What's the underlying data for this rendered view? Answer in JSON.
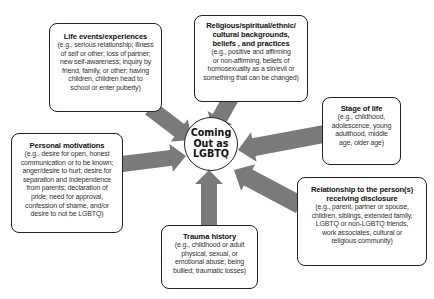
{
  "center": {
    "label_lines": [
      "Coming",
      "Out as",
      "LGBTQ"
    ]
  },
  "arrow_color": "#7a7a7a",
  "factors": [
    {
      "id": "life-events",
      "title": "Life events/experiences",
      "description_lines": [
        "(e.g., serious relationship; illness",
        "of self or other; loss of partner;",
        "new self-awareness; inquiry by",
        "friend, family, or other; having",
        "children, children head to",
        "school or enter puberty)"
      ]
    },
    {
      "id": "religious",
      "title_lines": [
        "Religious/spiritual/ethnic/",
        "cultural backgrounds,",
        "beliefs , and practices"
      ],
      "description_lines": [
        "(e.g., positive and affirming",
        "or non-affirming, beliefs of",
        "homosexuality as a sin/evil or",
        "something that can be changed)"
      ]
    },
    {
      "id": "stage-of-life",
      "title": "Stage of life",
      "description_lines": [
        "(e.g., childhood,",
        "adolescence, young",
        "adulthood, middle",
        "age, older age)"
      ]
    },
    {
      "id": "personal-motivations",
      "title": "Personal motivations",
      "description_lines": [
        "(e.g., desire for open, honest",
        "communication or to be known;",
        "anger/desire to hurt; desire for",
        "separation and independence",
        "from parents; declaration of",
        "pride; need for approval,",
        "confession of shame, and/or",
        "desire to not be LGBTQ)"
      ]
    },
    {
      "id": "relationship",
      "title_lines": [
        "Relationship to the person(s)",
        "receiving disclosure"
      ],
      "description_lines": [
        "(e.g., parent, partner or spouse,",
        "children, siblings, extended family,",
        "LGBTQ or non-LGBTQ friends,",
        "work associates, cultural or",
        "religious community)"
      ]
    },
    {
      "id": "trauma-history",
      "title": "Trauma history",
      "description_lines": [
        "(e.g., childhood or adult",
        "physical, sexual, or",
        "emotional abuse; being",
        "bullied; traumatic losses)"
      ]
    }
  ]
}
